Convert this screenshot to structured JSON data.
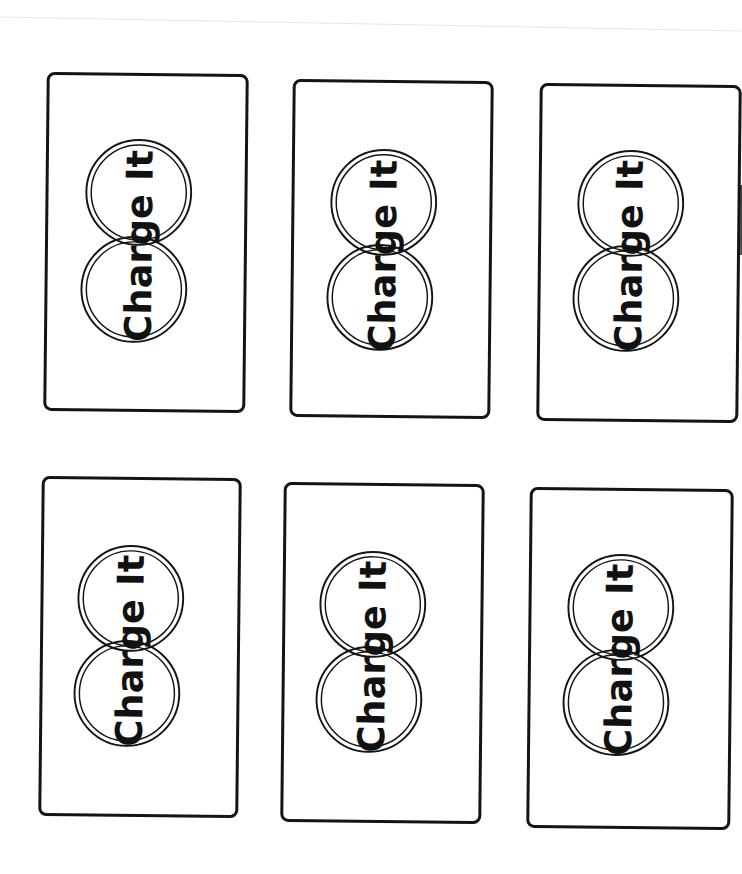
{
  "worksheet": {
    "cards": [
      {
        "label": "Charge It"
      },
      {
        "label": "Charge It"
      },
      {
        "label": "Charge It"
      },
      {
        "label": "Charge It"
      },
      {
        "label": "Charge It"
      },
      {
        "label": "Charge It"
      }
    ]
  },
  "colors": {
    "ink": "#141414",
    "paper": "#ffffff"
  }
}
